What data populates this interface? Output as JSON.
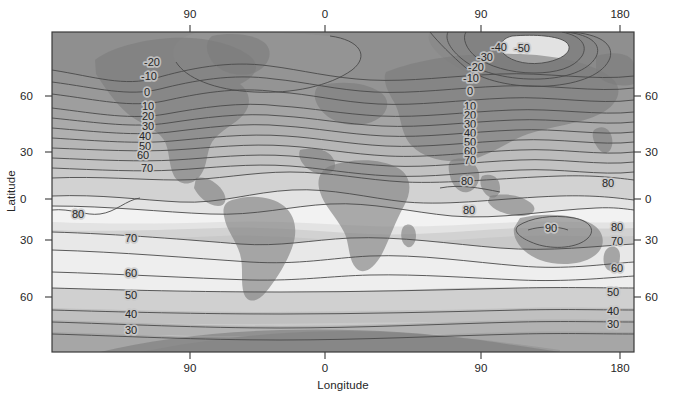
{
  "figure": {
    "xlabel": "Longitude",
    "ylabel": "Latitude",
    "plot": {
      "x": 52,
      "y": 32,
      "width": 582,
      "height": 320
    }
  },
  "axes": {
    "top_ticks": [
      {
        "label": "90",
        "px": 190
      },
      {
        "label": "0",
        "px": 325
      },
      {
        "label": "90",
        "px": 481
      },
      {
        "label": "180",
        "px": 620
      }
    ],
    "bottom_ticks": [
      {
        "label": "90",
        "px": 190
      },
      {
        "label": "0",
        "px": 325
      },
      {
        "label": "90",
        "px": 481
      },
      {
        "label": "180",
        "px": 620
      }
    ],
    "left_ticks": [
      {
        "label": "60",
        "py": 96
      },
      {
        "label": "30",
        "py": 152
      },
      {
        "label": "0",
        "py": 199
      },
      {
        "label": "30",
        "py": 240
      },
      {
        "label": "60",
        "py": 297
      }
    ],
    "right_ticks": [
      {
        "label": "60",
        "py": 96
      },
      {
        "label": "30",
        "py": 152
      },
      {
        "label": "0",
        "py": 199
      },
      {
        "label": "30",
        "py": 240
      },
      {
        "label": "60",
        "py": 297
      }
    ]
  },
  "chart_data": {
    "type": "heatmap",
    "title": "",
    "xlabel": "Longitude",
    "ylabel": "Latitude",
    "xlim": [
      -180,
      180
    ],
    "ylim": [
      -90,
      90
    ],
    "xtick_labels": [
      "90",
      "0",
      "90",
      "180"
    ],
    "ytick_labels": [
      "60",
      "30",
      "0",
      "30",
      "60"
    ],
    "grid": false,
    "legend": "none",
    "colormap": "grayscale: dark = low values, light = high values",
    "contour_interval": 10,
    "contour_levels": [
      -50,
      -40,
      -30,
      -20,
      -10,
      0,
      10,
      20,
      30,
      40,
      50,
      60,
      70,
      80,
      90
    ],
    "value_range": [
      -50,
      90
    ],
    "inline_labels": [
      {
        "text": "-20",
        "x": 152,
        "y": 66
      },
      {
        "text": "-10",
        "x": 149,
        "y": 80
      },
      {
        "text": "0",
        "x": 147,
        "y": 96
      },
      {
        "text": "10",
        "x": 148,
        "y": 110
      },
      {
        "text": "20",
        "x": 148,
        "y": 120
      },
      {
        "text": "30",
        "x": 148,
        "y": 130
      },
      {
        "text": "40",
        "x": 145,
        "y": 140
      },
      {
        "text": "50",
        "x": 145,
        "y": 150
      },
      {
        "text": "60",
        "x": 143,
        "y": 159
      },
      {
        "text": "70",
        "x": 147,
        "y": 172
      },
      {
        "text": "-50",
        "x": 522,
        "y": 52
      },
      {
        "text": "-40",
        "x": 499,
        "y": 51
      },
      {
        "text": "-30",
        "x": 485,
        "y": 61
      },
      {
        "text": "-20",
        "x": 476,
        "y": 71
      },
      {
        "text": "-10",
        "x": 471,
        "y": 82
      },
      {
        "text": "0",
        "x": 470,
        "y": 95
      },
      {
        "text": "10",
        "x": 470,
        "y": 110
      },
      {
        "text": "20",
        "x": 470,
        "y": 119
      },
      {
        "text": "30",
        "x": 470,
        "y": 128
      },
      {
        "text": "40",
        "x": 470,
        "y": 137
      },
      {
        "text": "50",
        "x": 470,
        "y": 146
      },
      {
        "text": "60",
        "x": 470,
        "y": 155
      },
      {
        "text": "70",
        "x": 470,
        "y": 164
      },
      {
        "text": "80",
        "x": 467,
        "y": 185
      },
      {
        "text": "80",
        "x": 608,
        "y": 187
      },
      {
        "text": "80",
        "x": 469,
        "y": 214
      },
      {
        "text": "90",
        "x": 551,
        "y": 232
      },
      {
        "text": "80",
        "x": 617,
        "y": 231
      },
      {
        "text": "70",
        "x": 617,
        "y": 245
      },
      {
        "text": "60",
        "x": 617,
        "y": 272
      },
      {
        "text": "50",
        "x": 613,
        "y": 296
      },
      {
        "text": "40",
        "x": 613,
        "y": 315
      },
      {
        "text": "30",
        "x": 613,
        "y": 328
      },
      {
        "text": "80",
        "x": 78,
        "y": 218
      },
      {
        "text": "70",
        "x": 131,
        "y": 242
      },
      {
        "text": "60",
        "x": 131,
        "y": 277
      },
      {
        "text": "50",
        "x": 131,
        "y": 299
      },
      {
        "text": "40",
        "x": 131,
        "y": 318
      },
      {
        "text": "30",
        "x": 131,
        "y": 334
      }
    ]
  },
  "palette": {
    "band_darkest": "#8f8f8f",
    "band_dark": "#9b9b9b",
    "band_mid_dark": "#a8a8a8",
    "band_mid": "#b5b5b5",
    "band_light": "#c4c4c4",
    "band_lighter": "#d4d4d4",
    "band_lightest": "#e6e6e6",
    "band_white": "#f2f2f2",
    "land_overlay": "#7d7d7d",
    "contour_line": "#4a4a4a",
    "axis_line": "#3a3a3a",
    "text": "#262626"
  }
}
